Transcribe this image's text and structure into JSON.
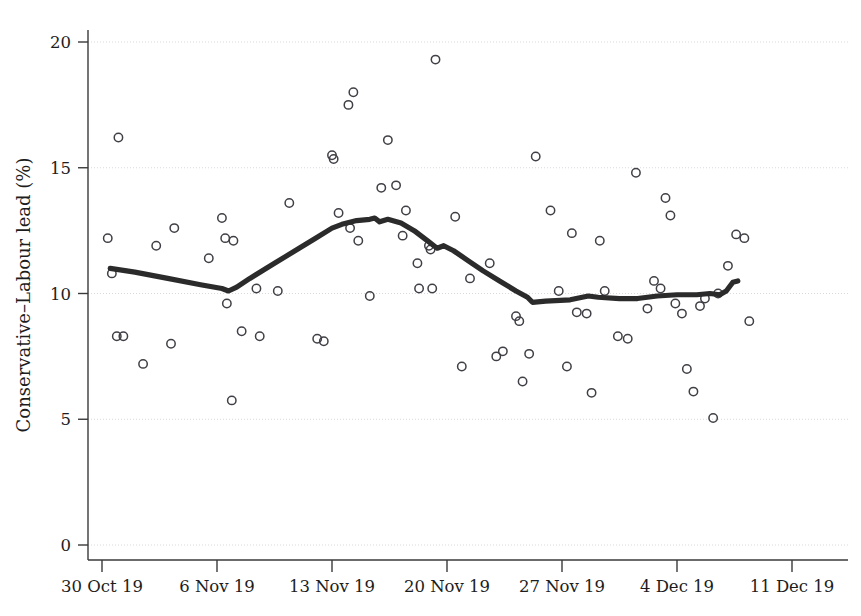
{
  "chart_data": {
    "type": "scatter",
    "title": "",
    "subtitle": "",
    "xlabel": "",
    "ylabel": "Conservative–Labour lead (%)",
    "ylim": [
      0,
      20
    ],
    "yticks": [
      0,
      5,
      10,
      15,
      20
    ],
    "ytick_labels": [
      "0",
      "5",
      "10",
      "15",
      "20"
    ],
    "xlim": [
      "30 Oct 19",
      "13 Dec 19"
    ],
    "xticks": [
      "30 Oct 19",
      "6 Nov 19",
      "13 Nov 19",
      "20 Nov 19",
      "27 Nov 19",
      "4 Dec 19",
      "11 Dec 19"
    ],
    "xtick_days": [
      0,
      7,
      14,
      21,
      28,
      35,
      42
    ],
    "grid": "horizontal-dotted",
    "legend": "none",
    "series": [
      {
        "name": "Individual poll results",
        "marker": "open-circle",
        "color": "#3f3f46",
        "points": [
          {
            "day": 0.6,
            "value": 10.8
          },
          {
            "day": 0.35,
            "value": 12.2
          },
          {
            "day": 0.9,
            "value": 8.3
          },
          {
            "day": 1.3,
            "value": 8.3
          },
          {
            "day": 1.0,
            "value": 16.2
          },
          {
            "day": 2.5,
            "value": 7.2
          },
          {
            "day": 3.3,
            "value": 11.9
          },
          {
            "day": 4.4,
            "value": 12.6
          },
          {
            "day": 4.2,
            "value": 8.0
          },
          {
            "day": 6.5,
            "value": 11.4
          },
          {
            "day": 7.3,
            "value": 13.0
          },
          {
            "day": 7.5,
            "value": 12.2
          },
          {
            "day": 7.6,
            "value": 9.6
          },
          {
            "day": 8.0,
            "value": 12.1
          },
          {
            "day": 7.9,
            "value": 5.75
          },
          {
            "day": 8.5,
            "value": 8.5
          },
          {
            "day": 9.4,
            "value": 10.2
          },
          {
            "day": 9.6,
            "value": 8.3
          },
          {
            "day": 10.7,
            "value": 10.1
          },
          {
            "day": 11.4,
            "value": 13.6
          },
          {
            "day": 13.1,
            "value": 8.2
          },
          {
            "day": 13.5,
            "value": 8.1
          },
          {
            "day": 14.0,
            "value": 15.5
          },
          {
            "day": 14.1,
            "value": 15.35
          },
          {
            "day": 14.4,
            "value": 13.2
          },
          {
            "day": 15.0,
            "value": 17.5
          },
          {
            "day": 15.3,
            "value": 18.0
          },
          {
            "day": 15.1,
            "value": 12.6
          },
          {
            "day": 15.6,
            "value": 12.1
          },
          {
            "day": 16.3,
            "value": 9.9
          },
          {
            "day": 17.0,
            "value": 14.2
          },
          {
            "day": 17.4,
            "value": 16.1
          },
          {
            "day": 17.9,
            "value": 14.3
          },
          {
            "day": 18.3,
            "value": 12.3
          },
          {
            "day": 18.5,
            "value": 13.3
          },
          {
            "day": 19.2,
            "value": 11.2
          },
          {
            "day": 19.3,
            "value": 10.2
          },
          {
            "day": 19.9,
            "value": 11.9
          },
          {
            "day": 20.0,
            "value": 11.75
          },
          {
            "day": 20.1,
            "value": 10.2
          },
          {
            "day": 20.3,
            "value": 19.3
          },
          {
            "day": 21.5,
            "value": 13.05
          },
          {
            "day": 21.9,
            "value": 7.1
          },
          {
            "day": 22.4,
            "value": 10.6
          },
          {
            "day": 23.6,
            "value": 11.2
          },
          {
            "day": 24.0,
            "value": 7.5
          },
          {
            "day": 24.4,
            "value": 7.7
          },
          {
            "day": 25.2,
            "value": 9.1
          },
          {
            "day": 25.4,
            "value": 8.9
          },
          {
            "day": 25.6,
            "value": 6.5
          },
          {
            "day": 26.0,
            "value": 7.6
          },
          {
            "day": 26.4,
            "value": 15.45
          },
          {
            "day": 27.3,
            "value": 13.3
          },
          {
            "day": 27.8,
            "value": 10.1
          },
          {
            "day": 28.3,
            "value": 7.1
          },
          {
            "day": 28.6,
            "value": 12.4
          },
          {
            "day": 28.9,
            "value": 9.25
          },
          {
            "day": 29.5,
            "value": 9.2
          },
          {
            "day": 29.8,
            "value": 6.05
          },
          {
            "day": 30.3,
            "value": 12.1
          },
          {
            "day": 30.6,
            "value": 10.1
          },
          {
            "day": 31.4,
            "value": 8.3
          },
          {
            "day": 32.0,
            "value": 8.2
          },
          {
            "day": 32.5,
            "value": 14.8
          },
          {
            "day": 33.2,
            "value": 9.4
          },
          {
            "day": 33.6,
            "value": 10.5
          },
          {
            "day": 34.0,
            "value": 10.2
          },
          {
            "day": 34.3,
            "value": 13.8
          },
          {
            "day": 34.6,
            "value": 13.1
          },
          {
            "day": 34.9,
            "value": 9.6
          },
          {
            "day": 35.3,
            "value": 9.2
          },
          {
            "day": 35.6,
            "value": 7.0
          },
          {
            "day": 36.0,
            "value": 6.1
          },
          {
            "day": 36.4,
            "value": 9.5
          },
          {
            "day": 36.7,
            "value": 9.8
          },
          {
            "day": 37.2,
            "value": 5.05
          },
          {
            "day": 37.5,
            "value": 10.0
          },
          {
            "day": 38.1,
            "value": 11.1
          },
          {
            "day": 38.6,
            "value": 12.35
          },
          {
            "day": 39.1,
            "value": 12.2
          },
          {
            "day": 39.4,
            "value": 8.9
          }
        ]
      },
      {
        "name": "Smoothed trend",
        "marker": "line",
        "color": "#2b2b2b",
        "points": [
          {
            "day": 0.5,
            "value": 11.0
          },
          {
            "day": 2.0,
            "value": 10.85
          },
          {
            "day": 4.0,
            "value": 10.6
          },
          {
            "day": 6.0,
            "value": 10.35
          },
          {
            "day": 7.3,
            "value": 10.2
          },
          {
            "day": 7.7,
            "value": 10.1
          },
          {
            "day": 8.2,
            "value": 10.25
          },
          {
            "day": 9.0,
            "value": 10.6
          },
          {
            "day": 10.5,
            "value": 11.2
          },
          {
            "day": 12.0,
            "value": 11.8
          },
          {
            "day": 13.0,
            "value": 12.2
          },
          {
            "day": 14.0,
            "value": 12.6
          },
          {
            "day": 14.6,
            "value": 12.75
          },
          {
            "day": 15.5,
            "value": 12.9
          },
          {
            "day": 16.3,
            "value": 12.95
          },
          {
            "day": 16.6,
            "value": 13.0
          },
          {
            "day": 16.9,
            "value": 12.85
          },
          {
            "day": 17.4,
            "value": 12.95
          },
          {
            "day": 18.2,
            "value": 12.8
          },
          {
            "day": 19.0,
            "value": 12.5
          },
          {
            "day": 19.8,
            "value": 12.1
          },
          {
            "day": 20.4,
            "value": 11.8
          },
          {
            "day": 20.8,
            "value": 11.9
          },
          {
            "day": 21.4,
            "value": 11.7
          },
          {
            "day": 22.3,
            "value": 11.3
          },
          {
            "day": 23.2,
            "value": 10.9
          },
          {
            "day": 24.2,
            "value": 10.5
          },
          {
            "day": 25.2,
            "value": 10.1
          },
          {
            "day": 25.9,
            "value": 9.85
          },
          {
            "day": 26.2,
            "value": 9.65
          },
          {
            "day": 27.0,
            "value": 9.7
          },
          {
            "day": 28.5,
            "value": 9.75
          },
          {
            "day": 29.6,
            "value": 9.9
          },
          {
            "day": 30.2,
            "value": 9.85
          },
          {
            "day": 31.5,
            "value": 9.8
          },
          {
            "day": 32.6,
            "value": 9.8
          },
          {
            "day": 33.8,
            "value": 9.9
          },
          {
            "day": 35.0,
            "value": 9.95
          },
          {
            "day": 36.2,
            "value": 9.95
          },
          {
            "day": 37.0,
            "value": 10.0
          },
          {
            "day": 37.6,
            "value": 9.95
          },
          {
            "day": 38.0,
            "value": 10.1
          },
          {
            "day": 38.4,
            "value": 10.45
          },
          {
            "day": 38.7,
            "value": 10.5
          }
        ]
      }
    ]
  }
}
